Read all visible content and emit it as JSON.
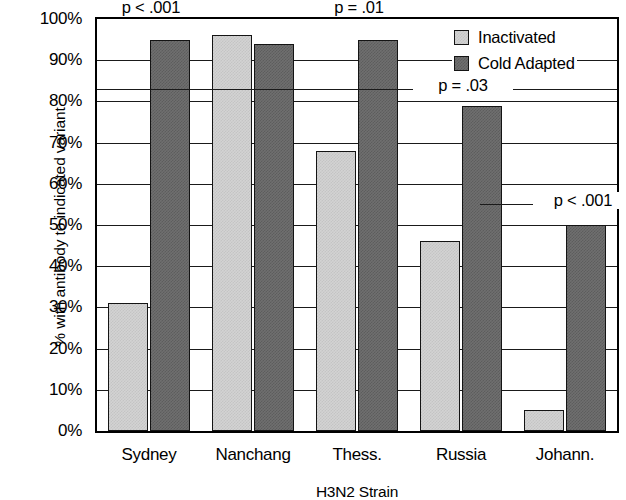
{
  "chart_data": {
    "type": "bar",
    "title": "",
    "xlabel": "H3N2 Strain",
    "ylabel": "% with antibody to indicated variant",
    "categories": [
      "Sydney",
      "Nanchang",
      "Thess.",
      "Russia",
      "Johann."
    ],
    "series": [
      {
        "name": "Inactivated",
        "color": "#d3d3d3",
        "values": [
          31,
          96,
          68,
          46,
          5
        ]
      },
      {
        "name": "Cold Adapted",
        "color": "#6f6f6f",
        "values": [
          95,
          94,
          95,
          79,
          50
        ]
      }
    ],
    "ylim": [
      0,
      100
    ],
    "ytick_labels": [
      "100%",
      "90%",
      "80%",
      "70%",
      "60%",
      "50%",
      "40%",
      "30%",
      "20%",
      "10%",
      "0%"
    ],
    "ytick_values": [
      100,
      90,
      80,
      70,
      60,
      50,
      40,
      30,
      20,
      10,
      0
    ],
    "grid": true,
    "legend_position": "top-right",
    "annotations": [
      {
        "text": "p < .001",
        "category": "Sydney",
        "value": 100
      },
      {
        "text": "p = .01",
        "category": "Thess.",
        "value": 100
      },
      {
        "text": "p = .03",
        "category": "Russia",
        "value": 83
      },
      {
        "text": "p < .001",
        "category": "Johann.",
        "value": 55
      }
    ]
  },
  "legend": {
    "items": [
      {
        "label": "Inactivated",
        "swatch": "light"
      },
      {
        "label": "Cold Adapted",
        "swatch": "dark"
      }
    ]
  },
  "axes": {
    "y_title": "% with antibody to indicated variant",
    "x_title": "H3N2 Strain",
    "y_ticks": [
      "100%",
      "90%",
      "80%",
      "70%",
      "60%",
      "50%",
      "40%",
      "30%",
      "20%",
      "10%",
      "0%"
    ],
    "x_ticks": [
      "Sydney",
      "Nanchang",
      "Thess.",
      "Russia",
      "Johann."
    ]
  },
  "pvalues": {
    "sydney": "p < .001",
    "thess": "p = .01",
    "russia": "p = .03",
    "johann": "p < .001"
  }
}
